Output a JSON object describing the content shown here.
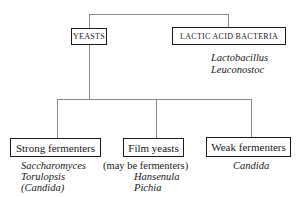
{
  "diagram": {
    "type": "tree",
    "root_groups": [
      {
        "label": "YEASTS",
        "children": [
          {
            "label": "Strong fermenters",
            "examples": [
              "Saccharomyces",
              "Torulopsis",
              "(Candida)"
            ]
          },
          {
            "label": "Film yeasts",
            "note": "(may be fermenters)",
            "examples": [
              "Hansenula",
              "Pichia"
            ]
          },
          {
            "label": "Weak fermenters",
            "examples": [
              "Candida"
            ]
          }
        ]
      },
      {
        "label": "LACTIC ACID BACTERIA",
        "examples": [
          "Lactobacillus",
          "Leuconostoc"
        ]
      }
    ]
  }
}
